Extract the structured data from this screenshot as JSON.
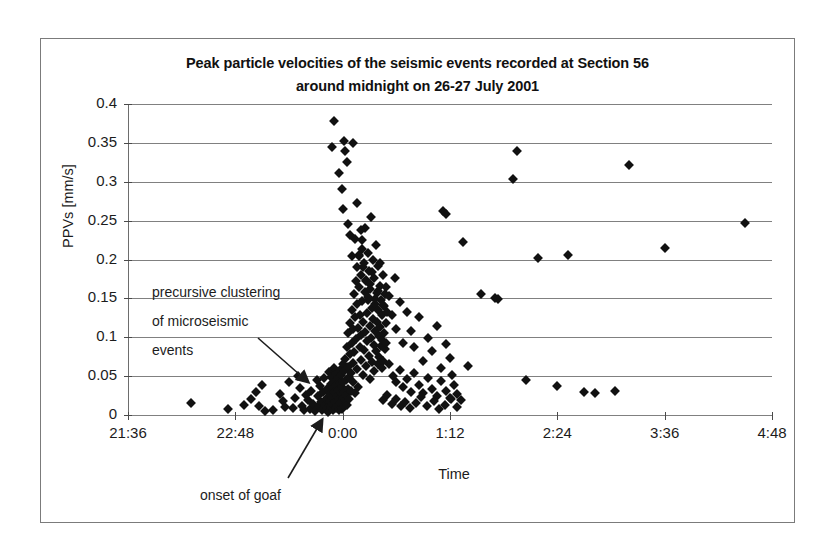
{
  "chart_data": {
    "type": "scatter",
    "title": "Peak particle velocities of the seismic events recorded at Section 56 around midnight on 26-27  July 2001",
    "title_line1": "Peak particle velocities of the seismic events recorded at Section 56",
    "title_line2": "around midnight on 26-27  July 2001",
    "xlabel": "Time",
    "ylabel": "PPVs [mm/s]",
    "grid": true,
    "legend": false,
    "xlim": [
      21.6,
      28.8
    ],
    "ylim": [
      0,
      0.4
    ],
    "xtick_labels": [
      "21:36",
      "22:48",
      "0:00",
      "1:12",
      "2:24",
      "3:36",
      "4:48"
    ],
    "xtick_hours": [
      21.6,
      22.8,
      24.0,
      25.2,
      26.4,
      27.6,
      28.8
    ],
    "ytick_labels": [
      "0",
      "0.05",
      "0.1",
      "0.15",
      "0.2",
      "0.25",
      "0.3",
      "0.35",
      "0.4"
    ],
    "ytick_values": [
      0,
      0.05,
      0.1,
      0.15,
      0.2,
      0.25,
      0.3,
      0.35,
      0.4
    ],
    "marker": "diamond",
    "marker_color": "#111111",
    "annotations": [
      {
        "name": "precursive-cluster-note",
        "lines": [
          "precursive clustering",
          "of microseismic",
          "events"
        ],
        "arrow_from": [
          258,
          338
        ],
        "arrow_to": [
          308,
          382
        ]
      },
      {
        "name": "onset-of-goaf-note",
        "lines": [
          "onset of goaf"
        ],
        "arrow_from": [
          288,
          478
        ],
        "arrow_to": [
          322,
          420
        ]
      }
    ],
    "points": [
      [
        22.3,
        0.016
      ],
      [
        22.72,
        0.008
      ],
      [
        22.9,
        0.013
      ],
      [
        22.97,
        0.021
      ],
      [
        23.03,
        0.03
      ],
      [
        23.06,
        0.011
      ],
      [
        23.1,
        0.038
      ],
      [
        23.13,
        0.005
      ],
      [
        23.22,
        0.006
      ],
      [
        23.3,
        0.027
      ],
      [
        23.33,
        0.018
      ],
      [
        23.36,
        0.01
      ],
      [
        23.4,
        0.042
      ],
      [
        23.44,
        0.009
      ],
      [
        23.47,
        0.022
      ],
      [
        23.5,
        0.05
      ],
      [
        23.52,
        0.035
      ],
      [
        23.55,
        0.012
      ],
      [
        23.57,
        0.006
      ],
      [
        23.59,
        0.026
      ],
      [
        23.61,
        0.019
      ],
      [
        23.63,
        0.008
      ],
      [
        23.65,
        0.031
      ],
      [
        23.67,
        0.014
      ],
      [
        23.69,
        0.005
      ],
      [
        23.71,
        0.045
      ],
      [
        23.72,
        0.024
      ],
      [
        23.74,
        0.011
      ],
      [
        23.75,
        0.037
      ],
      [
        23.76,
        0.017
      ],
      [
        23.77,
        0.007
      ],
      [
        23.78,
        0.029
      ],
      [
        23.79,
        0.048
      ],
      [
        23.8,
        0.013
      ],
      [
        23.81,
        0.021
      ],
      [
        23.82,
        0.009
      ],
      [
        23.83,
        0.033
      ],
      [
        23.84,
        0.004
      ],
      [
        23.85,
        0.055
      ],
      [
        23.855,
        0.018
      ],
      [
        23.86,
        0.027
      ],
      [
        23.865,
        0.04
      ],
      [
        23.87,
        0.01
      ],
      [
        23.875,
        0.049
      ],
      [
        23.88,
        0.023
      ],
      [
        23.885,
        0.014
      ],
      [
        23.89,
        0.035
      ],
      [
        23.895,
        0.006
      ],
      [
        23.9,
        0.061
      ],
      [
        23.905,
        0.029
      ],
      [
        23.91,
        0.044
      ],
      [
        23.915,
        0.017
      ],
      [
        23.92,
        0.053
      ],
      [
        23.925,
        0.009
      ],
      [
        23.93,
        0.038
      ],
      [
        23.935,
        0.025
      ],
      [
        23.94,
        0.012
      ],
      [
        23.945,
        0.047
      ],
      [
        23.95,
        0.032
      ],
      [
        23.955,
        0.02
      ],
      [
        23.96,
        0.006
      ],
      [
        23.965,
        0.058
      ],
      [
        23.97,
        0.041
      ],
      [
        23.975,
        0.015
      ],
      [
        23.98,
        0.028
      ],
      [
        23.985,
        0.051
      ],
      [
        23.99,
        0.008
      ],
      [
        23.995,
        0.036
      ],
      [
        24.0,
        0.022
      ],
      [
        24.0,
        0.066
      ],
      [
        24.005,
        0.043
      ],
      [
        24.01,
        0.011
      ],
      [
        24.015,
        0.03
      ],
      [
        24.02,
        0.057
      ],
      [
        24.025,
        0.019
      ],
      [
        24.03,
        0.072
      ],
      [
        24.035,
        0.045
      ],
      [
        24.04,
        0.026
      ],
      [
        24.045,
        0.088
      ],
      [
        24.05,
        0.013
      ],
      [
        24.055,
        0.062
      ],
      [
        24.06,
        0.034
      ],
      [
        24.065,
        0.105
      ],
      [
        24.07,
        0.049
      ],
      [
        24.075,
        0.021
      ],
      [
        24.08,
        0.078
      ],
      [
        24.085,
        0.118
      ],
      [
        24.09,
        0.054
      ],
      [
        24.095,
        0.031
      ],
      [
        24.1,
        0.092
      ],
      [
        24.105,
        0.135
      ],
      [
        24.11,
        0.067
      ],
      [
        24.115,
        0.043
      ],
      [
        24.12,
        0.11
      ],
      [
        24.125,
        0.156
      ],
      [
        24.13,
        0.081
      ],
      [
        24.135,
        0.028
      ],
      [
        24.14,
        0.126
      ],
      [
        24.145,
        0.172
      ],
      [
        24.15,
        0.098
      ],
      [
        24.155,
        0.059
      ],
      [
        24.16,
        0.143
      ],
      [
        24.165,
        0.19
      ],
      [
        24.17,
        0.112
      ],
      [
        24.175,
        0.036
      ],
      [
        24.18,
        0.165
      ],
      [
        24.185,
        0.206
      ],
      [
        24.19,
        0.088
      ],
      [
        24.195,
        0.128
      ],
      [
        24.2,
        0.071
      ],
      [
        24.205,
        0.18
      ],
      [
        24.21,
        0.103
      ],
      [
        24.215,
        0.225
      ],
      [
        24.22,
        0.146
      ],
      [
        24.225,
        0.052
      ],
      [
        24.23,
        0.119
      ],
      [
        24.235,
        0.196
      ],
      [
        24.24,
        0.084
      ],
      [
        24.245,
        0.158
      ],
      [
        24.25,
        0.24
      ],
      [
        24.255,
        0.107
      ],
      [
        24.26,
        0.063
      ],
      [
        24.265,
        0.173
      ],
      [
        24.27,
        0.131
      ],
      [
        24.275,
        0.095
      ],
      [
        24.28,
        0.209
      ],
      [
        24.285,
        0.148
      ],
      [
        24.29,
        0.076
      ],
      [
        24.295,
        0.185
      ],
      [
        24.3,
        0.115
      ],
      [
        24.305,
        0.046
      ],
      [
        24.31,
        0.162
      ],
      [
        24.315,
        0.255
      ],
      [
        24.32,
        0.099
      ],
      [
        24.325,
        0.137
      ],
      [
        24.33,
        0.068
      ],
      [
        24.335,
        0.2
      ],
      [
        24.34,
        0.124
      ],
      [
        24.345,
        0.09
      ],
      [
        24.35,
        0.176
      ],
      [
        24.355,
        0.057
      ],
      [
        24.36,
        0.143
      ],
      [
        24.365,
        0.108
      ],
      [
        24.37,
        0.219
      ],
      [
        24.375,
        0.082
      ],
      [
        24.38,
        0.157
      ],
      [
        24.385,
        0.12
      ],
      [
        24.39,
        0.065
      ],
      [
        24.395,
        0.192
      ],
      [
        24.4,
        0.135
      ],
      [
        24.405,
        0.101
      ],
      [
        24.41,
        0.074
      ],
      [
        24.415,
        0.166
      ],
      [
        24.42,
        0.113
      ],
      [
        24.425,
        0.089
      ],
      [
        24.43,
        0.148
      ],
      [
        24.435,
        0.06
      ],
      [
        24.44,
        0.128
      ],
      [
        24.445,
        0.097
      ],
      [
        24.45,
        0.18
      ],
      [
        24.455,
        0.07
      ],
      [
        24.46,
        0.14
      ],
      [
        24.465,
        0.106
      ],
      [
        24.47,
        0.085
      ],
      [
        24.475,
        0.155
      ],
      [
        24.48,
        0.118
      ],
      [
        24.49,
        0.092
      ],
      [
        24.5,
        0.132
      ],
      [
        23.88,
        0.345
      ],
      [
        23.9,
        0.378
      ],
      [
        23.96,
        0.311
      ],
      [
        23.99,
        0.291
      ],
      [
        24.0,
        0.265
      ],
      [
        24.02,
        0.352
      ],
      [
        24.03,
        0.34
      ],
      [
        24.05,
        0.325
      ],
      [
        24.06,
        0.246
      ],
      [
        24.08,
        0.232
      ],
      [
        24.1,
        0.205
      ],
      [
        24.12,
        0.35
      ],
      [
        24.14,
        0.226
      ],
      [
        24.16,
        0.273
      ],
      [
        24.18,
        0.204
      ],
      [
        24.2,
        0.238
      ],
      [
        24.22,
        0.214
      ],
      [
        24.23,
        0.19
      ],
      [
        24.26,
        0.172
      ],
      [
        24.28,
        0.152
      ],
      [
        24.3,
        0.168
      ],
      [
        24.33,
        0.184
      ],
      [
        24.36,
        0.149
      ],
      [
        24.39,
        0.159
      ],
      [
        24.42,
        0.196
      ],
      [
        24.45,
        0.142
      ],
      [
        24.48,
        0.165
      ],
      [
        24.52,
        0.153
      ],
      [
        24.55,
        0.128
      ],
      [
        24.58,
        0.176
      ],
      [
        24.6,
        0.11
      ],
      [
        24.64,
        0.145
      ],
      [
        24.68,
        0.093
      ],
      [
        24.72,
        0.132
      ],
      [
        24.76,
        0.108
      ],
      [
        24.8,
        0.087
      ],
      [
        24.85,
        0.126
      ],
      [
        24.9,
        0.07
      ],
      [
        24.95,
        0.099
      ],
      [
        25.0,
        0.082
      ],
      [
        25.05,
        0.114
      ],
      [
        25.1,
        0.061
      ],
      [
        25.15,
        0.091
      ],
      [
        25.2,
        0.073
      ],
      [
        24.52,
        0.066
      ],
      [
        24.56,
        0.05
      ],
      [
        24.6,
        0.042
      ],
      [
        24.64,
        0.058
      ],
      [
        24.68,
        0.036
      ],
      [
        24.72,
        0.046
      ],
      [
        24.76,
        0.03
      ],
      [
        24.8,
        0.054
      ],
      [
        24.85,
        0.039
      ],
      [
        24.9,
        0.028
      ],
      [
        24.95,
        0.047
      ],
      [
        25.0,
        0.033
      ],
      [
        25.05,
        0.025
      ],
      [
        25.1,
        0.044
      ],
      [
        25.15,
        0.031
      ],
      [
        25.2,
        0.022
      ],
      [
        25.22,
        0.052
      ],
      [
        25.25,
        0.038
      ],
      [
        25.28,
        0.027
      ],
      [
        25.32,
        0.019
      ],
      [
        24.45,
        0.019
      ],
      [
        24.5,
        0.026
      ],
      [
        24.55,
        0.014
      ],
      [
        24.6,
        0.021
      ],
      [
        24.65,
        0.011
      ],
      [
        24.7,
        0.017
      ],
      [
        24.75,
        0.009
      ],
      [
        24.82,
        0.015
      ],
      [
        24.88,
        0.023
      ],
      [
        24.94,
        0.012
      ],
      [
        25.02,
        0.018
      ],
      [
        25.08,
        0.008
      ],
      [
        25.14,
        0.013
      ],
      [
        25.21,
        0.02
      ],
      [
        25.28,
        0.01
      ],
      [
        25.12,
        0.263
      ],
      [
        25.15,
        0.258
      ],
      [
        25.35,
        0.222
      ],
      [
        25.4,
        0.063
      ],
      [
        25.55,
        0.156
      ],
      [
        25.7,
        0.15
      ],
      [
        25.74,
        0.149
      ],
      [
        25.9,
        0.303
      ],
      [
        25.95,
        0.339
      ],
      [
        26.05,
        0.045
      ],
      [
        26.18,
        0.202
      ],
      [
        26.4,
        0.037
      ],
      [
        26.52,
        0.206
      ],
      [
        26.7,
        0.029
      ],
      [
        26.82,
        0.028
      ],
      [
        27.05,
        0.031
      ],
      [
        27.2,
        0.322
      ],
      [
        27.6,
        0.215
      ],
      [
        28.5,
        0.247
      ]
    ]
  }
}
